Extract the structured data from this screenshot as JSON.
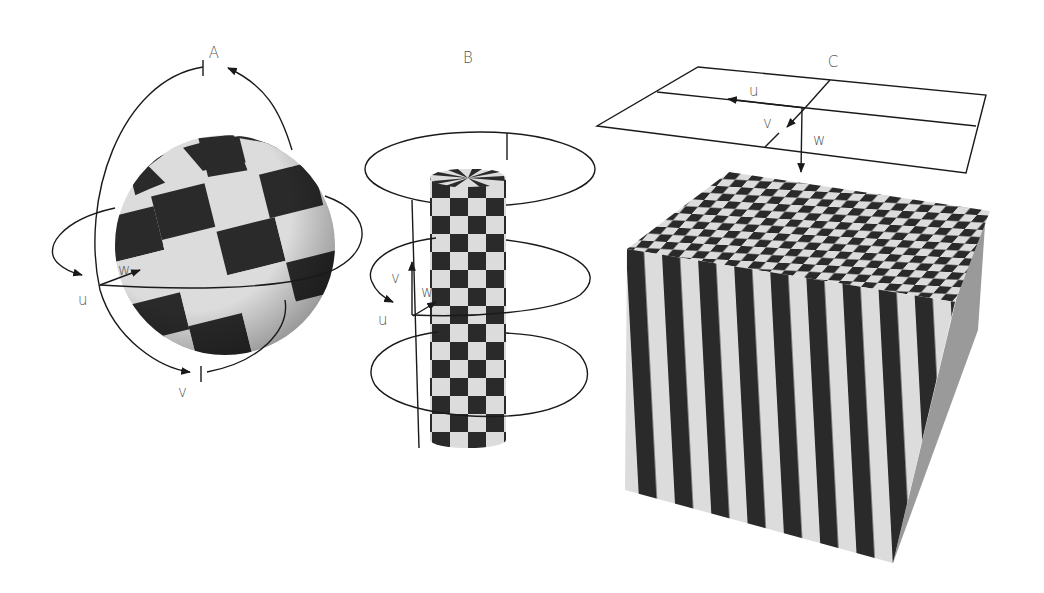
{
  "figure": {
    "panels": [
      {
        "id": "A",
        "title": "A",
        "shape": "sphere",
        "texture": "checkerboard",
        "axis_labels": {
          "u": "u",
          "v": "v",
          "w": "w"
        }
      },
      {
        "id": "B",
        "title": "B",
        "shape": "cylinder",
        "texture": "checkerboard",
        "axis_labels": {
          "u": "u",
          "v": "v",
          "w": "w"
        }
      },
      {
        "id": "C",
        "title": "C",
        "shape": "cube",
        "texture": "checkerboard top, stripes side",
        "axis_labels": {
          "u": "u",
          "v": "v",
          "w": "w"
        }
      }
    ]
  },
  "colors": {
    "dark": "#2a2a2a",
    "light": "#dcdcdc",
    "line": "#1a1a1a",
    "label": "#555555"
  }
}
